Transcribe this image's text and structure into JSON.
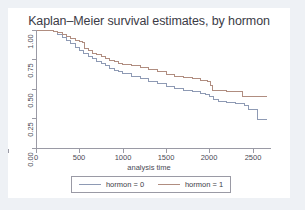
{
  "figure": {
    "title": "Kaplan–Meier survival estimates, by hormon",
    "background": "#ffffff",
    "page_background": "#eef1f5"
  },
  "axes": {
    "x_title": "analysis time",
    "x_ticks": [
      "0",
      "500",
      "1000",
      "1500",
      "2000",
      "2500"
    ],
    "y_ticks": [
      "1.00",
      "0.75",
      "0.50",
      "0.25",
      "0.00"
    ],
    "axis_color": "#9a9aa5"
  },
  "legend": {
    "entries": [
      {
        "label": "hormon = 0",
        "color": "#8e9ab4"
      },
      {
        "label": "hormon = 1",
        "color": "#b08d80"
      }
    ]
  },
  "chart_data": {
    "type": "line",
    "title": "Kaplan–Meier survival estimates, by hormon",
    "xlabel": "analysis time",
    "ylabel": "",
    "xlim": [
      0,
      2700
    ],
    "ylim": [
      0.0,
      1.0
    ],
    "xticks": [
      0,
      500,
      1000,
      1500,
      2000,
      2500
    ],
    "yticks": [
      0.0,
      0.25,
      0.5,
      0.75,
      1.0
    ],
    "grid": false,
    "legend_position": "below-axes",
    "step": "post",
    "series": [
      {
        "name": "hormon = 0",
        "color": "#8e9ab4",
        "x": [
          0,
          150,
          200,
          250,
          300,
          350,
          400,
          450,
          500,
          550,
          600,
          650,
          700,
          750,
          800,
          850,
          900,
          950,
          1000,
          1100,
          1200,
          1300,
          1400,
          1500,
          1600,
          1700,
          1800,
          1900,
          1950,
          2000,
          2050,
          2100,
          2200,
          2300,
          2350,
          2400,
          2450,
          2500,
          2550,
          2660
        ],
        "y": [
          1.0,
          1.0,
          0.985,
          0.965,
          0.94,
          0.915,
          0.885,
          0.855,
          0.825,
          0.8,
          0.775,
          0.755,
          0.735,
          0.715,
          0.695,
          0.675,
          0.66,
          0.645,
          0.63,
          0.605,
          0.585,
          0.565,
          0.545,
          0.525,
          0.505,
          0.49,
          0.475,
          0.46,
          0.45,
          0.44,
          0.41,
          0.39,
          0.385,
          0.38,
          0.375,
          0.36,
          0.33,
          0.33,
          0.24,
          0.24
        ]
      },
      {
        "name": "hormon = 1",
        "color": "#b08d80",
        "x": [
          0,
          150,
          200,
          250,
          300,
          350,
          400,
          450,
          500,
          540,
          560,
          600,
          650,
          700,
          750,
          800,
          850,
          900,
          950,
          1000,
          1100,
          1200,
          1300,
          1400,
          1500,
          1600,
          1700,
          1800,
          1870,
          1900,
          1980,
          2010,
          2040,
          2200,
          2300,
          2350,
          2380,
          2450,
          2550,
          2660
        ],
        "y": [
          1.0,
          1.0,
          0.99,
          0.975,
          0.96,
          0.945,
          0.93,
          0.915,
          0.9,
          0.895,
          0.845,
          0.825,
          0.805,
          0.79,
          0.775,
          0.76,
          0.745,
          0.735,
          0.72,
          0.71,
          0.695,
          0.68,
          0.665,
          0.645,
          0.625,
          0.61,
          0.6,
          0.59,
          0.585,
          0.57,
          0.565,
          0.53,
          0.485,
          0.48,
          0.48,
          0.475,
          0.44,
          0.44,
          0.44,
          0.44
        ]
      }
    ]
  }
}
